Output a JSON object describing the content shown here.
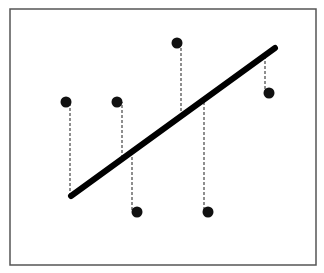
{
  "diagram": {
    "type": "regression-residuals",
    "frame": {
      "x": 10,
      "y": 9,
      "width": 306,
      "height": 256,
      "stroke": "#555555"
    },
    "regression_line": {
      "x1": 71,
      "y1": 196,
      "x2": 275,
      "y2": 48,
      "color": "#000000",
      "width": 6
    },
    "points": [
      {
        "x": 66,
        "y": 102,
        "line_x": 70,
        "line_y": 196
      },
      {
        "x": 117,
        "y": 102,
        "line_x": 122,
        "line_y": 158
      },
      {
        "x": 177,
        "y": 43,
        "line_x": 181,
        "line_y": 116
      },
      {
        "x": 137,
        "y": 212,
        "line_x": 132,
        "line_y": 152
      },
      {
        "x": 208,
        "y": 212,
        "line_x": 204,
        "line_y": 97
      },
      {
        "x": 269,
        "y": 93,
        "line_x": 265,
        "line_y": 56
      }
    ],
    "point_color": "#111111",
    "residual_color": "#444444"
  }
}
